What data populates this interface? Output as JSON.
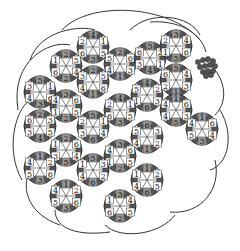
{
  "diagram": {
    "title": "",
    "cell_labels_domain": [
      "1",
      "2",
      "3",
      "4",
      "5",
      "6"
    ],
    "colors": {
      "line": "#333333",
      "dark": "#555555",
      "mid": "#9a9a9a",
      "light": "#ffffff",
      "grape": "#555555"
    },
    "ring_radius": 16,
    "label_radius": 12,
    "rings": [
      {
        "cx": 93,
        "cy": 47,
        "labels": [
          "4",
          "1",
          "5",
          "3",
          "6",
          "2"
        ]
      },
      {
        "cx": 120,
        "cy": 64,
        "labels": [
          "2",
          "6",
          "3",
          "1",
          "4",
          "5"
        ]
      },
      {
        "cx": 66,
        "cy": 66,
        "labels": [
          "2",
          "5",
          "4",
          "2",
          "6",
          "1"
        ]
      },
      {
        "cx": 150,
        "cy": 58,
        "labels": [
          "5",
          "2",
          "1",
          "4",
          "3",
          "6"
        ]
      },
      {
        "cx": 176,
        "cy": 46,
        "labels": [
          "3",
          "4",
          "6",
          "5",
          "1",
          "2"
        ]
      },
      {
        "cx": 176,
        "cy": 80,
        "labels": [
          "5",
          "4",
          "3",
          "1",
          "2",
          "6"
        ]
      },
      {
        "cx": 40,
        "cy": 92,
        "labels": [
          "5",
          "1",
          "6",
          "3",
          "4",
          "3"
        ]
      },
      {
        "cx": 93,
        "cy": 82,
        "labels": [
          "2",
          "5",
          "6",
          "1",
          "4",
          "3"
        ]
      },
      {
        "cx": 147,
        "cy": 95,
        "labels": [
          "4",
          "2",
          "3",
          "6",
          "1",
          "5"
        ]
      },
      {
        "cx": 66,
        "cy": 106,
        "labels": [
          "3",
          "6",
          "5",
          "2",
          "1",
          "4"
        ]
      },
      {
        "cx": 120,
        "cy": 110,
        "labels": [
          "4",
          "1",
          "5",
          "3",
          "6",
          "2"
        ]
      },
      {
        "cx": 176,
        "cy": 110,
        "labels": [
          "1",
          "6",
          "3",
          "5",
          "4",
          "4"
        ]
      },
      {
        "cx": 40,
        "cy": 126,
        "labels": [
          "2",
          "3",
          "5",
          "4",
          "3",
          "6"
        ]
      },
      {
        "cx": 93,
        "cy": 127,
        "labels": [
          "5",
          "1",
          "4",
          "6",
          "3",
          "2"
        ]
      },
      {
        "cx": 147,
        "cy": 137,
        "labels": [
          "6",
          "3",
          "2",
          "1",
          "4",
          "5"
        ]
      },
      {
        "cx": 202,
        "cy": 129,
        "labels": [
          "1",
          "6",
          "4",
          "3",
          "5",
          "4"
        ]
      },
      {
        "cx": 66,
        "cy": 150,
        "labels": [
          "2",
          "6",
          "4",
          "5",
          "3",
          "1"
        ]
      },
      {
        "cx": 120,
        "cy": 156,
        "labels": [
          "3",
          "6",
          "5",
          "2",
          "1",
          "4"
        ]
      },
      {
        "cx": 40,
        "cy": 168,
        "labels": [
          "1",
          "2",
          "6",
          "3",
          "5",
          "4"
        ]
      },
      {
        "cx": 93,
        "cy": 170,
        "labels": [
          "5",
          "3",
          "2",
          "6",
          "4",
          "1"
        ]
      },
      {
        "cx": 147,
        "cy": 180,
        "labels": [
          "1",
          "2",
          "5",
          "6",
          "4",
          "1"
        ]
      },
      {
        "cx": 66,
        "cy": 196,
        "labels": [
          "1",
          "2",
          "6",
          "3",
          "5",
          "4"
        ]
      },
      {
        "cx": 120,
        "cy": 206,
        "labels": [
          "3",
          "4",
          "5",
          "2",
          "6",
          "1"
        ]
      }
    ],
    "outer_arcs": [
      "M 62 30 C 90 0, 170 5, 200 40",
      "M 30 60 C 40 30, 80 25, 95 30",
      "M 18 110 C 10 60, 50 40, 70 45",
      "M 22 180 C 5 150, 15 110, 30 100",
      "M 60 225 C 30 215, 20 190, 30 170",
      "M 110 232 C 80 236, 55 230, 55 210",
      "M 175 215 C 160 235, 120 240, 105 225",
      "M 215 160 C 222 190, 200 215, 170 212",
      "M 220 110 C 235 135, 228 165, 210 170",
      "M 205 60 C 225 75, 230 100, 215 115",
      "M 130 30 C 150 10, 190 15, 200 35",
      "M 150 22 C 175 20, 200 30, 206 52"
    ],
    "grape_cluster": {
      "cx": 207,
      "cy": 67,
      "berries": [
        [
          198,
          62
        ],
        [
          203,
          60
        ],
        [
          208,
          59
        ],
        [
          213,
          61
        ],
        [
          200,
          67
        ],
        [
          205,
          66
        ],
        [
          210,
          65
        ],
        [
          215,
          66
        ],
        [
          203,
          72
        ],
        [
          208,
          71
        ],
        [
          213,
          71
        ],
        [
          206,
          76
        ],
        [
          211,
          75
        ]
      ]
    }
  }
}
